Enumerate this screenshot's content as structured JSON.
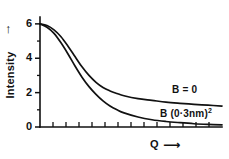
{
  "figure": {
    "background": "#ffffff",
    "ink": "#111111"
  },
  "axes": {
    "y": {
      "title": "Intensity",
      "arrow": "↑",
      "labeled_ticks": [
        "6",
        "4",
        "2",
        "0"
      ],
      "tick_values": [
        6,
        4,
        2,
        0
      ],
      "minor_tick_values": [
        5,
        3,
        1
      ],
      "range": [
        0,
        6.4
      ]
    },
    "x": {
      "title": "Q",
      "arrow": "⟶",
      "tick_count": 13,
      "labeled_ticks": [],
      "range": [
        0,
        13
      ]
    }
  },
  "annotations": {
    "curve_b_zero": "B = 0",
    "curve_b_value": "B (0·3nm)",
    "curve_b_value_exponent": "2"
  },
  "chart_data": {
    "type": "line",
    "title": "",
    "subtitle": "",
    "xlabel": "Q",
    "ylabel": "Intensity",
    "xlim": [
      0,
      13
    ],
    "ylim": [
      0,
      6.4
    ],
    "grid": false,
    "legend": "inline-annotations",
    "x": [
      0,
      0.5,
      1,
      1.5,
      2,
      2.5,
      3,
      3.5,
      4,
      4.5,
      5,
      5.5,
      6,
      7,
      8,
      9,
      10,
      11,
      12,
      13
    ],
    "series": [
      {
        "name": "B = 0",
        "label": "B = 0",
        "color": "#111111",
        "values": [
          6.0,
          5.9,
          5.65,
          5.25,
          4.7,
          4.1,
          3.5,
          3.0,
          2.6,
          2.3,
          2.1,
          1.95,
          1.82,
          1.65,
          1.55,
          1.45,
          1.38,
          1.32,
          1.27,
          1.22
        ]
      },
      {
        "name": "B (0·3nm)^2",
        "label": "B (0·3nm)²",
        "color": "#111111",
        "values": [
          6.0,
          5.8,
          5.45,
          4.9,
          4.25,
          3.55,
          2.9,
          2.35,
          1.9,
          1.52,
          1.22,
          1.0,
          0.82,
          0.58,
          0.42,
          0.32,
          0.25,
          0.19,
          0.15,
          0.12
        ]
      }
    ]
  }
}
